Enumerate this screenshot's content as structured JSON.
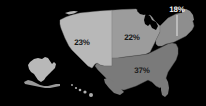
{
  "figure": {
    "background_color": "#000000"
  },
  "chart_data": {
    "type": "map",
    "title": "",
    "subtitle": "",
    "map_scope": "United States (regions)",
    "value_suffix": "%",
    "legend": null,
    "regions": [
      {
        "name": "West",
        "label": "23%",
        "value": 23,
        "color": "#b8b8b8",
        "label_color": "#1a1a1a",
        "label_x": 82,
        "label_y": 43,
        "callout": false
      },
      {
        "name": "Midwest",
        "label": "22%",
        "value": 22,
        "color": "#9c9c9c",
        "label_color": "#1a1a1a",
        "label_x": 132,
        "label_y": 38,
        "callout": false
      },
      {
        "name": "South",
        "label": "37%",
        "value": 37,
        "color": "#7a7a7a",
        "label_color": "#1a1a1a",
        "label_x": 142,
        "label_y": 71,
        "callout": false
      },
      {
        "name": "Northeast",
        "label": "18%",
        "value": 18,
        "color": "#8e8e8e",
        "label_color": "#f2f2f2",
        "label_x": 177,
        "label_y": 10,
        "callout": true,
        "leader_x": 177,
        "leader_y": 15,
        "leader_height": 21
      }
    ],
    "insets": [
      {
        "name": "Alaska",
        "color": "#b8b8b8",
        "value": null,
        "label": ""
      },
      {
        "name": "Hawaii",
        "color": "#b8b8b8",
        "value": null,
        "label": ""
      }
    ],
    "colors": {
      "background": "#000000",
      "west": "#b8b8b8",
      "midwest": "#9c9c9c",
      "south": "#7a7a7a",
      "northeast": "#8e8e8e",
      "border": "#6e6e6e"
    }
  }
}
